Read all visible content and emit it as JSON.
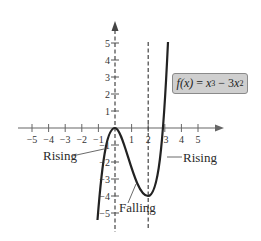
{
  "function_label": {
    "name": "f(x)",
    "equals": " = ",
    "term1_base": "x",
    "term1_exp": "3",
    "minus": " − 3",
    "term2_base": "x",
    "term2_exp": "2"
  },
  "axes": {
    "x_ticks": [
      "−5",
      "−4",
      "−3",
      "−2",
      "−1",
      "1",
      "2",
      "3",
      "4",
      "5"
    ],
    "y_ticks": [
      "5",
      "4",
      "3",
      "2",
      "1",
      "−1",
      "−2",
      "−3",
      "−4",
      "−5"
    ]
  },
  "annotations": {
    "rising_left": "Rising",
    "falling": "Falling",
    "rising_right": "Rising"
  },
  "colors": {
    "curve": "#222222",
    "axis": "#555555",
    "dashed": "#444444",
    "box_fill": "#cfcfcf"
  }
}
